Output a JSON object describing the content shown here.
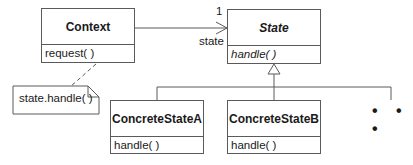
{
  "diagram": {
    "type": "uml-class-diagram",
    "pattern": "State",
    "classes": [
      {
        "id": "context",
        "name": "Context",
        "abstract": false,
        "operations": [
          "request( )"
        ]
      },
      {
        "id": "state",
        "name": "State",
        "abstract": true,
        "operations": [
          "handle( )"
        ]
      },
      {
        "id": "concrete_a",
        "name": "ConcreteStateA",
        "abstract": false,
        "operations": [
          "handle( )"
        ]
      },
      {
        "id": "concrete_b",
        "name": "ConcreteStateB",
        "abstract": false,
        "operations": [
          "handle( )"
        ]
      }
    ],
    "association": {
      "from": "Context",
      "to": "State",
      "multiplicity": "1",
      "role": "state"
    },
    "note": {
      "text": "state.handle( )",
      "attached_to": "request( )"
    },
    "generalization": {
      "parent": "State",
      "children": [
        "ConcreteStateA",
        "ConcreteStateB",
        "..."
      ]
    },
    "ellipsis": "• • •"
  },
  "colors": {
    "line": "#5a5a5a",
    "background": "#ffffff",
    "text": "#1a1a1a"
  }
}
